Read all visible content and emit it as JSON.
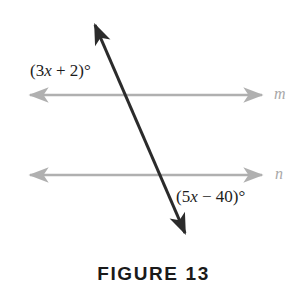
{
  "figure": {
    "caption": "FIGURE 13",
    "background_color": "#ffffff",
    "parallel_line_color": "#b0b0b0",
    "transversal_color": "#2b2b2b",
    "label_color": "#1c1c1c",
    "line_name_color": "#a8a8a8",
    "lines": [
      {
        "name": "m",
        "kind": "parallel-line",
        "orientation": "horizontal",
        "y": 95,
        "x_start": 27,
        "x_end": 265,
        "arrowheads": "both"
      },
      {
        "name": "n",
        "kind": "parallel-line",
        "orientation": "horizontal",
        "y": 175,
        "x_start": 27,
        "x_end": 265,
        "arrowheads": "both"
      }
    ],
    "transversal": {
      "kind": "transversal-line",
      "x_start": 92,
      "y_start": 18,
      "x_end": 188,
      "y_end": 240,
      "arrowheads": "both"
    },
    "intersections": [
      {
        "line": "m",
        "x": 124,
        "y": 95
      },
      {
        "line": "n",
        "x": 166,
        "y": 175
      }
    ],
    "angle_labels": [
      {
        "id": "upper",
        "prefix": "(3",
        "variable": "x",
        "suffix": " + 2)°",
        "text": "(3x + 2)°",
        "position": "above-left-of-line-m"
      },
      {
        "id": "lower",
        "prefix": "(5",
        "variable": "x",
        "suffix": " − 40)°",
        "text": "(5x − 40)°",
        "position": "below-right-of-line-n"
      }
    ]
  }
}
